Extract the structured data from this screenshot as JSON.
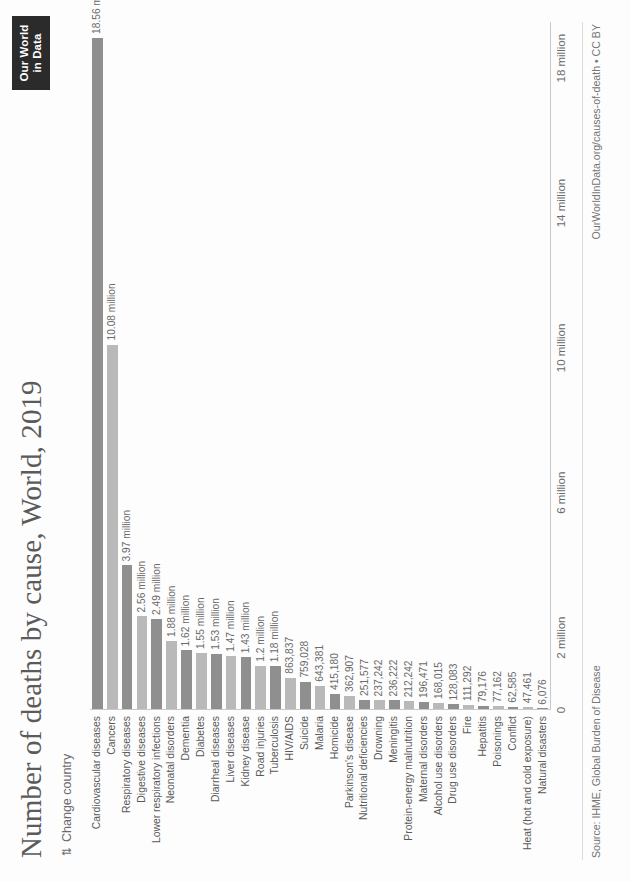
{
  "logo": {
    "line1": "Our World",
    "line2": "in Data"
  },
  "header": {
    "title": "Number of deaths by cause, World, 2019",
    "change_country_label": "Change country",
    "change_country_icon": "swap-vertical-icon"
  },
  "footer": {
    "source": "Source: IHME, Global Burden of Disease",
    "credit": "OurWorldInData.org/causes-of-death • CC BY"
  },
  "colors": {
    "bar_dark": "#8f8f8f",
    "bar_light": "#b9b9b9",
    "text": "#5b5b5b",
    "axis": "#c9c9c9",
    "logo_bg": "#2b2b2b"
  },
  "chart_data": {
    "type": "bar",
    "orientation": "horizontal",
    "title": "Number of deaths by cause, World, 2019",
    "xlabel": "",
    "ylabel": "",
    "xlim": [
      0,
      19000000
    ],
    "grid": false,
    "legend": null,
    "tick_labels": [
      "0",
      "2 million",
      "6 million",
      "10 million",
      "14 million",
      "18 million"
    ],
    "tick_values": [
      0,
      2000000,
      6000000,
      10000000,
      14000000,
      18000000
    ],
    "categories": [
      "Cardiovascular diseases",
      "Cancers",
      "Respiratory diseases",
      "Digestive diseases",
      "Lower respiratory infections",
      "Neonatal disorders",
      "Dementia",
      "Diabetes",
      "Diarrheal diseases",
      "Liver diseases",
      "Kidney disease",
      "Road injuries",
      "Tuberculosis",
      "HIV/AIDS",
      "Suicide",
      "Malaria",
      "Homicide",
      "Parkinson's disease",
      "Nutritional deficiencies",
      "Drowning",
      "Meningitis",
      "Protein-energy malnutrition",
      "Maternal disorders",
      "Alcohol use disorders",
      "Drug use disorders",
      "Fire",
      "Hepatitis",
      "Poisonings",
      "Conflict",
      "Heat (hot and cold exposure)",
      "Natural disasters"
    ],
    "values": [
      18560000,
      10080000,
      3970000,
      2560000,
      2490000,
      1880000,
      1620000,
      1550000,
      1530000,
      1470000,
      1430000,
      1200000,
      1180000,
      863837,
      759028,
      643381,
      415180,
      362907,
      251577,
      237242,
      236222,
      212242,
      196471,
      168015,
      128083,
      111292,
      79176,
      77162,
      62585,
      47461,
      6076
    ],
    "value_labels": [
      "18.56 million",
      "10.08 million",
      "3.97 million",
      "2.56 million",
      "2.49 million",
      "1.88 million",
      "1.62 million",
      "1.55 million",
      "1.53 million",
      "1.47 million",
      "1.43 million",
      "1.2 million",
      "1.18 million",
      "863,837",
      "759,028",
      "643,381",
      "415,180",
      "362,907",
      "251,577",
      "237,242",
      "236,222",
      "212,242",
      "196,471",
      "168,015",
      "128,083",
      "111,292",
      "79,176",
      "77,162",
      "62,585",
      "47,461",
      "6,076"
    ]
  }
}
